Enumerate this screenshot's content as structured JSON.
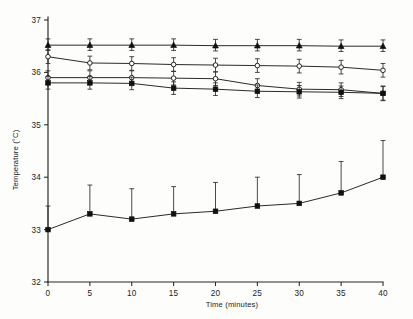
{
  "figure": {
    "background_color": "#fdfdfc",
    "ink_color": "#1f1f1f"
  },
  "axes": {
    "x_title": "Time (minutes)",
    "y_title": "Temperature (°C)",
    "x_ticks": [
      "0",
      "5",
      "10",
      "15",
      "20",
      "25",
      "30",
      "35",
      "40"
    ],
    "y_ticks": [
      "32",
      "33",
      "34",
      "35",
      "36",
      "37"
    ]
  },
  "chart_data": {
    "type": "line",
    "title": "",
    "subtitle": "",
    "xlabel": "Time (minutes)",
    "ylabel": "Temperature (°C)",
    "xlim": [
      0,
      40
    ],
    "ylim": [
      32,
      37
    ],
    "x": [
      0,
      5,
      10,
      15,
      20,
      25,
      30,
      35,
      40
    ],
    "xticks": [
      0,
      5,
      10,
      15,
      20,
      25,
      30,
      35,
      40
    ],
    "yticks": [
      32,
      33,
      34,
      35,
      36,
      37
    ],
    "grid": false,
    "legend": "none",
    "error_bars": true,
    "series": [
      {
        "name": "series-filled-triangle",
        "marker": "filled-triangle",
        "values": [
          36.52,
          36.52,
          36.52,
          36.52,
          36.51,
          36.51,
          36.51,
          36.5,
          36.5
        ],
        "err_up": [
          0.12,
          0.12,
          0.12,
          0.12,
          0.12,
          0.12,
          0.12,
          0.12,
          0.12
        ],
        "err_down": [
          0.1,
          0.1,
          0.1,
          0.1,
          0.1,
          0.1,
          0.1,
          0.1,
          0.1
        ]
      },
      {
        "name": "series-open-circle-upper",
        "marker": "open-circle",
        "values": [
          36.3,
          36.18,
          36.17,
          36.15,
          36.14,
          36.13,
          36.12,
          36.1,
          36.04
        ],
        "err_up": [
          0.13,
          0.13,
          0.13,
          0.13,
          0.13,
          0.13,
          0.13,
          0.13,
          0.13
        ],
        "err_down": [
          0.13,
          0.13,
          0.13,
          0.13,
          0.13,
          0.13,
          0.13,
          0.13,
          0.13
        ]
      },
      {
        "name": "series-open-circle-lower",
        "marker": "open-circle",
        "values": [
          35.9,
          35.9,
          35.9,
          35.89,
          35.88,
          35.75,
          35.68,
          35.67,
          35.6
        ],
        "err_up": [
          0.13,
          0.13,
          0.13,
          0.13,
          0.13,
          0.13,
          0.13,
          0.13,
          0.13
        ],
        "err_down": [
          0.13,
          0.13,
          0.13,
          0.13,
          0.13,
          0.13,
          0.13,
          0.13,
          0.13
        ]
      },
      {
        "name": "series-filled-square-upper",
        "marker": "filled-square",
        "values": [
          35.8,
          35.8,
          35.79,
          35.7,
          35.68,
          35.64,
          35.63,
          35.62,
          35.6
        ],
        "err_up": [
          0.12,
          0.12,
          0.12,
          0.12,
          0.12,
          0.12,
          0.12,
          0.12,
          0.14
        ],
        "err_down": [
          0.12,
          0.12,
          0.12,
          0.12,
          0.12,
          0.12,
          0.12,
          0.12,
          0.14
        ]
      },
      {
        "name": "series-filled-square-lower",
        "marker": "filled-square",
        "values": [
          33.0,
          33.3,
          33.2,
          33.3,
          33.35,
          33.45,
          33.5,
          33.7,
          34.0
        ],
        "err_up": [
          0.45,
          0.55,
          0.58,
          0.52,
          0.55,
          0.55,
          0.55,
          0.6,
          0.7
        ],
        "err_down": [
          0.0,
          0.0,
          0.0,
          0.0,
          0.0,
          0.0,
          0.0,
          0.0,
          0.0
        ]
      }
    ]
  }
}
